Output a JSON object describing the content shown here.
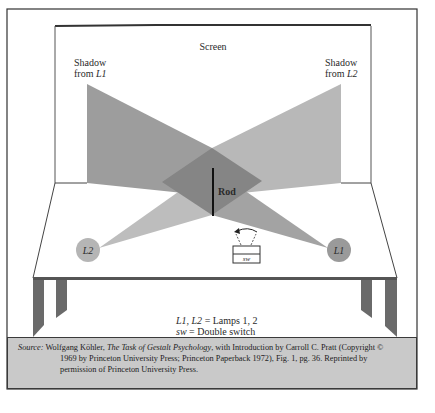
{
  "figure": {
    "labels": {
      "screen": "Screen",
      "shadow_l1_line1": "Shadow",
      "shadow_l1_line2_prefix": "from ",
      "shadow_l1_line2_lamp": "L1",
      "shadow_l2_line1": "Shadow",
      "shadow_l2_line2_prefix": "from ",
      "shadow_l2_line2_lamp": "L2",
      "rod": "Rod",
      "lamp_left": "L2",
      "lamp_right": "L1",
      "switch": "sw"
    },
    "legend": {
      "line1_symbols": "L1, L2",
      "line1_text": " = Lamps 1, 2",
      "line2_symbol": "sw",
      "line2_text": " = Double switch"
    },
    "colors": {
      "shadow": "#9a9a9a",
      "shadow_light": "#b9b9b9",
      "overlap": "#858585",
      "lamp": "#b3b3b3",
      "frame": "#333333",
      "caption_bg": "#c9c9c9"
    }
  },
  "caption": {
    "source_label": "Source:",
    "author": " Wolfgang Köhler, ",
    "title": "The Task of Gestalt Psychology",
    "line1_rest": ", with Introduction by Carroll C. Pratt (Copyright ©",
    "line2": "1969 by Princeton University Press; Princeton Paperback 1972), Fig. 1, pg. 36.  Reprinted by",
    "line3": "permission of Princeton University Press."
  }
}
